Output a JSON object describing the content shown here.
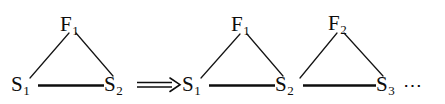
{
  "figure": {
    "background_color": "#ffffff",
    "ink_color": "#0d0d0d",
    "relation_symbol": "double-right-arrow",
    "relation_symbol_glyph": "=>",
    "continuation_marker": "⋯",
    "left_graph": {
      "name": "single-triangle",
      "nodes": [
        {
          "id": "S1",
          "base": "S",
          "subscript": "1",
          "role": "vertex-bottom-left"
        },
        {
          "id": "F1",
          "base": "F",
          "subscript": "1",
          "role": "vertex-apex"
        },
        {
          "id": "S2",
          "base": "S",
          "subscript": "2",
          "role": "vertex-bottom-right"
        }
      ],
      "edges": [
        {
          "from": "S1",
          "to": "F1",
          "style": "thin-diagonal"
        },
        {
          "from": "F1",
          "to": "S2",
          "style": "thin-diagonal"
        },
        {
          "from": "S1",
          "to": "S2",
          "style": "thick-horizontal"
        }
      ]
    },
    "right_graph": {
      "name": "triangle-chain",
      "nodes": [
        {
          "id": "S1",
          "base": "S",
          "subscript": "1",
          "role": "vertex-bottom-left"
        },
        {
          "id": "F1",
          "base": "F",
          "subscript": "1",
          "role": "vertex-apex-first"
        },
        {
          "id": "S2",
          "base": "S",
          "subscript": "2",
          "role": "vertex-bottom-middle"
        },
        {
          "id": "F2",
          "base": "F",
          "subscript": "2",
          "role": "vertex-apex-second"
        },
        {
          "id": "S3",
          "base": "S",
          "subscript": "3",
          "role": "vertex-bottom-right"
        }
      ],
      "edges": [
        {
          "from": "S1",
          "to": "F1",
          "style": "thin-diagonal"
        },
        {
          "from": "F1",
          "to": "S2",
          "style": "thin-diagonal"
        },
        {
          "from": "S2",
          "to": "F2",
          "style": "thin-diagonal"
        },
        {
          "from": "F2",
          "to": "S3",
          "style": "thin-diagonal"
        },
        {
          "from": "S1",
          "to": "S2",
          "style": "thick-horizontal"
        },
        {
          "from": "S2",
          "to": "S3",
          "style": "thick-horizontal"
        }
      ]
    }
  }
}
